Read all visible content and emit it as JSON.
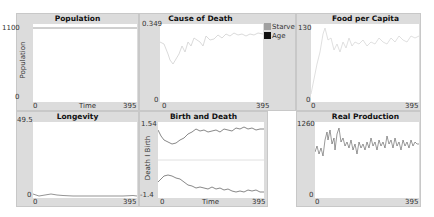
{
  "plots": {
    "population": {
      "title": "Population",
      "ymax": "1100",
      "ymin": "0",
      "xmin": "0",
      "xmax": "395",
      "xlabel": "Time",
      "ylabel": "Population"
    },
    "cause_of_death": {
      "title": "Cause of Death",
      "ymax": "0.349",
      "ymin": "0",
      "xmin": "0",
      "xmax": "395",
      "legend": [
        {
          "label": "Starve",
          "color": "#a0a0a0"
        },
        {
          "label": "Age",
          "color": "#111111"
        }
      ]
    },
    "food_per_capita": {
      "title": "Food per Capita",
      "ymax": "130",
      "ymin": "0",
      "xmin": "0",
      "xmax": "395"
    },
    "longevity": {
      "title": "Longevity",
      "ymax": "49.5",
      "ymin": "0",
      "xmin": "0",
      "xmax": "395"
    },
    "birth_and_death": {
      "title": "Birth and Death",
      "ymax": "1.54",
      "ymin": "-1.4",
      "xmin": "0",
      "xmax": "395",
      "xlabel": "Time",
      "ylabel": "Death  I  Birth"
    },
    "real_production": {
      "title": "Real Production",
      "ymax": "1260",
      "ymin": "0",
      "xmin": "0",
      "xmax": "395"
    }
  },
  "colors": {
    "panel_bg": "#dcdcdc",
    "plot_bg": "#ffffff",
    "faint_line": "#d8d8d8",
    "dark_line": "#555555"
  }
}
